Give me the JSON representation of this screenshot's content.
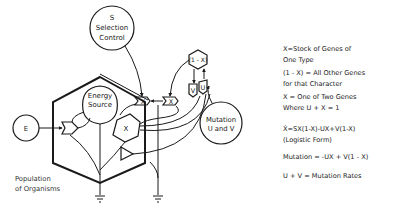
{
  "diagram": {
    "nodes": {
      "selection": {
        "line1": "S",
        "line2": "Selection",
        "line3": "Control"
      },
      "energy_source": {
        "line1": "Energy",
        "line2": "Source"
      },
      "external_source": {
        "label": "E"
      },
      "gene_stock": {
        "label": "X"
      },
      "other_genes": {
        "label": "(1 - X)"
      },
      "mutation_source": {
        "line1": "Mutation",
        "line2": "U and V"
      },
      "multiplier_1": {
        "label": "X"
      },
      "multiplier_2": {
        "label": "X"
      },
      "mutation_v": {
        "label": "V"
      },
      "mutation_u": {
        "label": "U"
      }
    },
    "population_label": {
      "line1": "Population",
      "line2": "of Organisms"
    }
  },
  "legend": {
    "items": [
      {
        "line1": "X=Stock of Genes of",
        "line2": "One Type"
      },
      {
        "line1": "(1 - X) = All Other Genes",
        "line2": "for that Character"
      },
      {
        "line1": "X = One of Two Genes",
        "line2": "Where U + X = 1"
      },
      {
        "line1": "Ẋ=SX(1-X)-UX+V(1-X)",
        "line2": "(Logistic Form)"
      },
      {
        "line1": "Mutation = -UX + V(1 - X)",
        "line2": ""
      },
      {
        "line1": "U + V = Mutation Rates",
        "line2": ""
      }
    ]
  },
  "colors": {
    "ink": "#1a1a1a",
    "background": "#ffffff"
  }
}
